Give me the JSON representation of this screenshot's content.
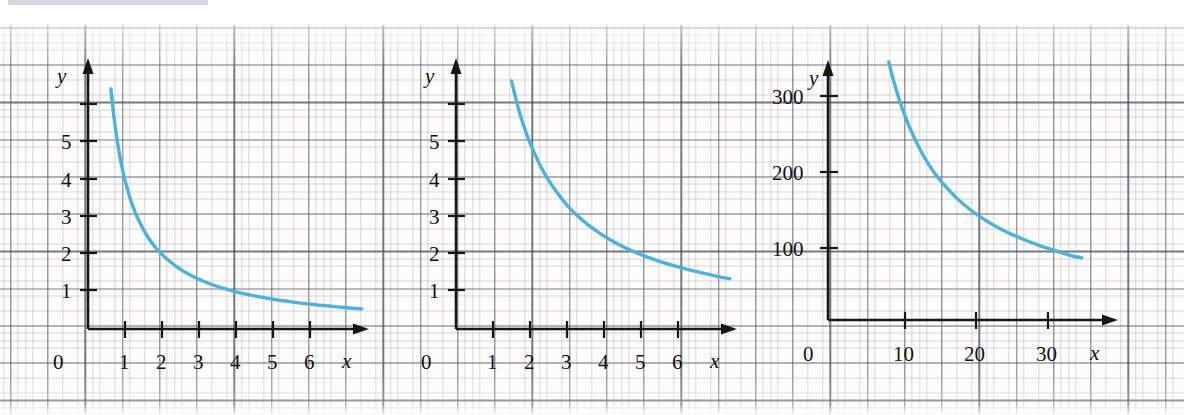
{
  "figure": {
    "kind": "graph-paper-figure",
    "panel_count": 3,
    "curve_color": "#4CB2DC",
    "background": "#fdfcfa",
    "grid_color": "#464b55"
  },
  "chart_data": [
    {
      "id": "panel-a",
      "type": "line",
      "title": "",
      "xlabel": "x",
      "ylabel": "y",
      "xlim": [
        0,
        7.2
      ],
      "ylim": [
        0,
        6.8
      ],
      "xticks": [
        1,
        2,
        3,
        4,
        5,
        6
      ],
      "xtick_labels": [
        "1",
        "2",
        "3",
        "4",
        "5",
        "6"
      ],
      "yticks": [
        1,
        2,
        3,
        4,
        5,
        6
      ],
      "ytick_labels": [
        "1",
        "2",
        "3",
        "4",
        "5",
        ""
      ],
      "origin_label": "0",
      "grid": true,
      "legend": "none",
      "series": [
        {
          "name": "y = 4/x",
          "x": [
            0.62,
            0.7,
            0.8,
            0.9,
            1.0,
            1.2,
            1.4,
            1.6,
            1.8,
            2.0,
            2.4,
            2.8,
            3.2,
            3.6,
            4.0,
            4.5,
            5.0,
            5.5,
            6.0,
            6.5,
            7.0,
            7.4
          ],
          "y": [
            6.45,
            5.71,
            5.0,
            4.44,
            4.0,
            3.33,
            2.86,
            2.5,
            2.22,
            2.0,
            1.67,
            1.43,
            1.25,
            1.11,
            1.0,
            0.89,
            0.8,
            0.73,
            0.67,
            0.62,
            0.57,
            0.54
          ]
        }
      ]
    },
    {
      "id": "panel-b",
      "type": "line",
      "title": "",
      "xlabel": "x",
      "ylabel": "y",
      "xlim": [
        0,
        7.2
      ],
      "ylim": [
        0,
        6.8
      ],
      "xticks": [
        1,
        2,
        3,
        4,
        5,
        6
      ],
      "xtick_labels": [
        "1",
        "2",
        "3",
        "4",
        "5",
        "6"
      ],
      "yticks": [
        1,
        2,
        3,
        4,
        5,
        6
      ],
      "ytick_labels": [
        "1",
        "2",
        "3",
        "4",
        "5",
        ""
      ],
      "origin_label": "0",
      "grid": true,
      "legend": "none",
      "series": [
        {
          "name": "y = 10/x",
          "x": [
            1.5,
            1.7,
            1.9,
            2.0,
            2.3,
            2.6,
            3.0,
            3.4,
            3.8,
            4.2,
            4.6,
            5.0,
            5.5,
            6.0,
            6.5,
            7.0,
            7.4
          ],
          "y": [
            6.67,
            5.88,
            5.26,
            5.0,
            4.35,
            3.85,
            3.33,
            2.94,
            2.63,
            2.38,
            2.17,
            2.0,
            1.82,
            1.67,
            1.54,
            1.43,
            1.35
          ]
        }
      ]
    },
    {
      "id": "panel-c",
      "type": "line",
      "title": "",
      "xlabel": "x",
      "ylabel": "y",
      "xlim": [
        0,
        38
      ],
      "ylim": [
        0,
        360
      ],
      "xticks": [
        10,
        20,
        30
      ],
      "xtick_labels": [
        "10",
        "20",
        "30"
      ],
      "yticks": [
        100,
        200,
        300
      ],
      "ytick_labels": [
        "100",
        "200",
        "300"
      ],
      "origin_label": "0",
      "grid": true,
      "legend": "none",
      "series": [
        {
          "name": "y = 2900/x",
          "x": [
            8.5,
            9,
            10,
            11,
            12,
            13,
            14,
            15,
            16,
            18,
            20,
            22,
            24,
            26,
            28,
            30,
            32,
            34,
            35.5
          ],
          "y": [
            341,
            322,
            290,
            264,
            242,
            223,
            207,
            193,
            181,
            161,
            145,
            132,
            121,
            112,
            104,
            97,
            91,
            85,
            82
          ]
        }
      ]
    }
  ],
  "panels": [
    {
      "name": "graph-a",
      "y_axis_label": "y",
      "x_axis_label": "x",
      "origin_label": "0",
      "x_tick_labels": [
        "1",
        "2",
        "3",
        "4",
        "5",
        "6"
      ],
      "y_tick_labels": [
        "1",
        "2",
        "3",
        "4",
        "5"
      ]
    },
    {
      "name": "graph-b",
      "y_axis_label": "y",
      "x_axis_label": "x",
      "origin_label": "0",
      "x_tick_labels": [
        "1",
        "2",
        "3",
        "4",
        "5",
        "6"
      ],
      "y_tick_labels": [
        "1",
        "2",
        "3",
        "4",
        "5"
      ]
    },
    {
      "name": "graph-c",
      "y_axis_label": "y",
      "x_axis_label": "x",
      "origin_label": "0",
      "x_tick_labels": [
        "10",
        "20",
        "30"
      ],
      "y_tick_labels": [
        "100",
        "200",
        "300"
      ]
    }
  ]
}
